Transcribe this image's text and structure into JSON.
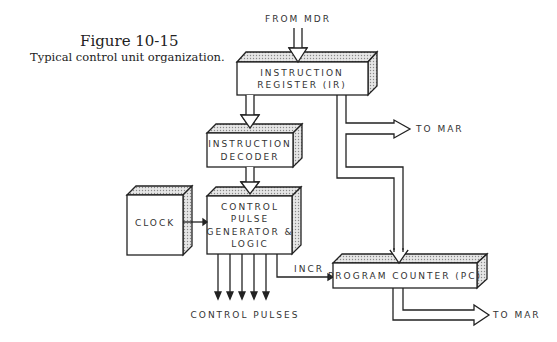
{
  "figure": {
    "number": "Figure 10-15",
    "caption": "Typical control unit organization."
  },
  "blocks": {
    "ir": {
      "line1": "INSTRUCTION",
      "line2": "REGISTER (IR)"
    },
    "decoder": {
      "line1": "INSTRUCTION",
      "line2": "DECODER"
    },
    "clock": {
      "label": "CLOCK"
    },
    "cpg": {
      "line1": "CONTROL",
      "line2": "PULSE",
      "line3": "GENERATOR &",
      "line4": "LOGIC"
    },
    "pc": {
      "label": "PROGRAM COUNTER (PC)"
    }
  },
  "signals": {
    "from_mdr": "FROM MDR",
    "ir_to_mar": "TO MAR",
    "pc_to_mar": "TO MAR",
    "incr": "INCR",
    "control_pulses": "CONTROL PULSES"
  },
  "colors": {
    "line": "#222222",
    "shade": "#bdbdbd",
    "text": "#333333"
  }
}
